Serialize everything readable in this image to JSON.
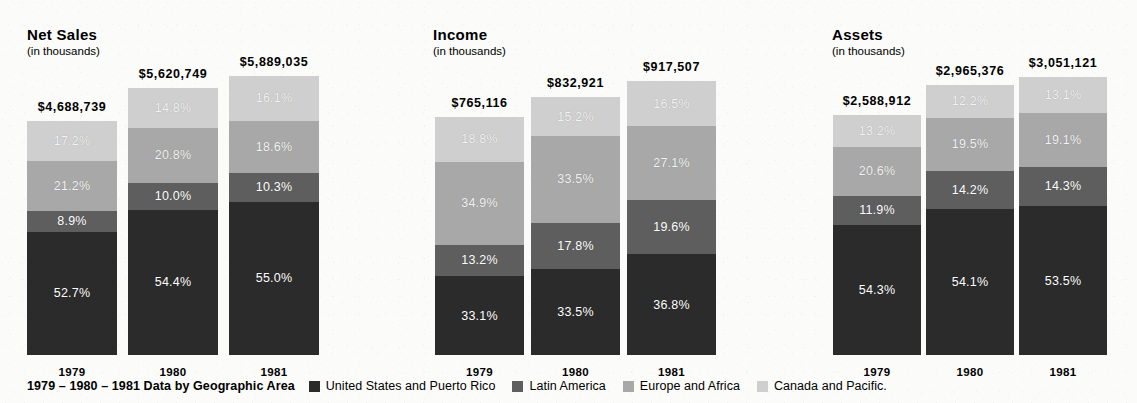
{
  "colors": {
    "united_states": "#2b2b2b",
    "latin_america": "#5e5e5e",
    "europe_africa": "#a8a8a8",
    "canada_pacific": "#cfcfcf",
    "background": "#fbfbf9",
    "text": "#000000",
    "label_text": "#ffffff"
  },
  "legend": {
    "caption": "1979 – 1980 – 1981 Data by Geographic Area",
    "items": [
      {
        "label": "United States and Puerto Rico",
        "color": "#2b2b2b"
      },
      {
        "label": "Latin America",
        "color": "#5e5e5e"
      },
      {
        "label": "Europe and Africa",
        "color": "#a8a8a8"
      },
      {
        "label": "Canada and Pacific.",
        "color": "#cfcfcf"
      }
    ]
  },
  "panels": [
    {
      "title": "Net Sales",
      "subtitle": "(in thousands)",
      "bars": [
        {
          "year": "1979",
          "total_label": "$4,688,739",
          "segments": [
            {
              "label": "17.2%",
              "value": 17.2,
              "series": "Canada and Pacific."
            },
            {
              "label": "21.2%",
              "value": 21.2,
              "series": "Europe and Africa"
            },
            {
              "label": "8.9%",
              "value": 8.9,
              "series": "Latin America"
            },
            {
              "label": "52.7%",
              "value": 52.7,
              "series": "United States and Puerto Rico"
            }
          ]
        },
        {
          "year": "1980",
          "total_label": "$5,620,749",
          "segments": [
            {
              "label": "14.8%",
              "value": 14.8,
              "series": "Canada and Pacific."
            },
            {
              "label": "20.8%",
              "value": 20.8,
              "series": "Europe and Africa"
            },
            {
              "label": "10.0%",
              "value": 10.0,
              "series": "Latin America"
            },
            {
              "label": "54.4%",
              "value": 54.4,
              "series": "United States and Puerto Rico"
            }
          ]
        },
        {
          "year": "1981",
          "total_label": "$5,889,035",
          "segments": [
            {
              "label": "16.1%",
              "value": 16.1,
              "series": "Canada and Pacific."
            },
            {
              "label": "18.6%",
              "value": 18.6,
              "series": "Europe and Africa"
            },
            {
              "label": "10.3%",
              "value": 10.3,
              "series": "Latin America"
            },
            {
              "label": "55.0%",
              "value": 55.0,
              "series": "United States and Puerto Rico"
            }
          ]
        }
      ]
    },
    {
      "title": "Income",
      "subtitle": "(in thousands)",
      "bars": [
        {
          "year": "1979",
          "total_label": "$765,116",
          "segments": [
            {
              "label": "18.8%",
              "value": 18.8,
              "series": "Canada and Pacific."
            },
            {
              "label": "34.9%",
              "value": 34.9,
              "series": "Europe and Africa"
            },
            {
              "label": "13.2%",
              "value": 13.2,
              "series": "Latin America"
            },
            {
              "label": "33.1%",
              "value": 33.1,
              "series": "United States and Puerto Rico"
            }
          ]
        },
        {
          "year": "1980",
          "total_label": "$832,921",
          "segments": [
            {
              "label": "15.2%",
              "value": 15.2,
              "series": "Canada and Pacific."
            },
            {
              "label": "33.5%",
              "value": 33.5,
              "series": "Europe and Africa"
            },
            {
              "label": "17.8%",
              "value": 17.8,
              "series": "Latin America"
            },
            {
              "label": "33.5%",
              "value": 33.5,
              "series": "United States and Puerto Rico"
            }
          ]
        },
        {
          "year": "1981",
          "total_label": "$917,507",
          "segments": [
            {
              "label": "16.5%",
              "value": 16.5,
              "series": "Canada and Pacific."
            },
            {
              "label": "27.1%",
              "value": 27.1,
              "series": "Europe and Africa"
            },
            {
              "label": "19.6%",
              "value": 19.6,
              "series": "Latin America"
            },
            {
              "label": "36.8%",
              "value": 36.8,
              "series": "United States and Puerto Rico"
            }
          ]
        }
      ]
    },
    {
      "title": "Assets",
      "subtitle": "(in thousands)",
      "bars": [
        {
          "year": "1979",
          "total_label": "$2,588,912",
          "segments": [
            {
              "label": "13.2%",
              "value": 13.2,
              "series": "Canada and Pacific."
            },
            {
              "label": "20.6%",
              "value": 20.6,
              "series": "Europe and Africa"
            },
            {
              "label": "11.9%",
              "value": 11.9,
              "series": "Latin America"
            },
            {
              "label": "54.3%",
              "value": 54.3,
              "series": "United States and Puerto Rico"
            }
          ]
        },
        {
          "year": "1980",
          "total_label": "$2,965,376",
          "segments": [
            {
              "label": "12.2%",
              "value": 12.2,
              "series": "Canada and Pacific."
            },
            {
              "label": "19.5%",
              "value": 19.5,
              "series": "Europe and Africa"
            },
            {
              "label": "14.2%",
              "value": 14.2,
              "series": "Latin America"
            },
            {
              "label": "54.1%",
              "value": 54.1,
              "series": "United States and Puerto Rico"
            }
          ]
        },
        {
          "year": "1981",
          "total_label": "$3,051,121",
          "segments": [
            {
              "label": "13.1%",
              "value": 13.1,
              "series": "Canada and Pacific."
            },
            {
              "label": "19.1%",
              "value": 19.1,
              "series": "Europe and Africa"
            },
            {
              "label": "14.3%",
              "value": 14.3,
              "series": "Latin America"
            },
            {
              "label": "53.5%",
              "value": 53.5,
              "series": "United States and Puerto Rico"
            }
          ]
        }
      ]
    }
  ],
  "chart_data": {
    "type": "bar",
    "title": "1979 – 1980 – 1981 Data by Geographic Area",
    "subtype": "stacked-percentage",
    "categories": [
      "1979",
      "1980",
      "1981"
    ],
    "xlabel": "",
    "ylabel": "",
    "ylim": [
      0,
      100
    ],
    "grid": false,
    "legend_position": "bottom",
    "series_names": [
      "United States and Puerto Rico",
      "Latin America",
      "Europe and Africa",
      "Canada and Pacific."
    ],
    "panels": [
      {
        "title": "Net Sales",
        "units": "(in thousands)",
        "totals": [
          4688739,
          5620749,
          5889035
        ],
        "total_labels": [
          "$4,688,739",
          "$5,620,749",
          "$5,889,035"
        ],
        "series": [
          {
            "name": "United States and Puerto Rico",
            "values": [
              52.7,
              54.4,
              55.0
            ]
          },
          {
            "name": "Latin America",
            "values": [
              8.9,
              10.0,
              10.3
            ]
          },
          {
            "name": "Europe and Africa",
            "values": [
              21.2,
              20.8,
              18.6
            ]
          },
          {
            "name": "Canada and Pacific.",
            "values": [
              17.2,
              14.8,
              16.1
            ]
          }
        ]
      },
      {
        "title": "Income",
        "units": "(in thousands)",
        "totals": [
          765116,
          832921,
          917507
        ],
        "total_labels": [
          "$765,116",
          "$832,921",
          "$917,507"
        ],
        "series": [
          {
            "name": "United States and Puerto Rico",
            "values": [
              33.1,
              33.5,
              36.8
            ]
          },
          {
            "name": "Latin America",
            "values": [
              13.2,
              17.8,
              19.6
            ]
          },
          {
            "name": "Europe and Africa",
            "values": [
              34.9,
              33.5,
              27.1
            ]
          },
          {
            "name": "Canada and Pacific.",
            "values": [
              18.8,
              15.2,
              16.5
            ]
          }
        ]
      },
      {
        "title": "Assets",
        "units": "(in thousands)",
        "totals": [
          2588912,
          2965376,
          3051121
        ],
        "total_labels": [
          "$2,588,912",
          "$2,965,376",
          "$3,051,121"
        ],
        "series": [
          {
            "name": "United States and Puerto Rico",
            "values": [
              54.3,
              54.1,
              53.5
            ]
          },
          {
            "name": "Latin America",
            "values": [
              11.9,
              14.2,
              14.3
            ]
          },
          {
            "name": "Europe and Africa",
            "values": [
              20.6,
              19.5,
              19.1
            ]
          },
          {
            "name": "Canada and Pacific.",
            "values": [
              13.2,
              12.2,
              13.1
            ]
          }
        ]
      }
    ]
  }
}
